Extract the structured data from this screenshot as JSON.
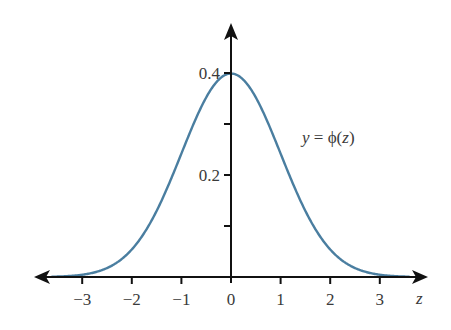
{
  "chart_data": {
    "type": "line",
    "title": "",
    "function": "standard normal probability density",
    "xlabel": "z",
    "ylabel": "",
    "annotation": "y = φ(z)",
    "annotation_parts": {
      "lhs": "y",
      "eq": " = ",
      "fn": "ϕ",
      "open": "(",
      "arg": "z",
      "close": ")"
    },
    "xlim": [
      -3.8,
      3.9
    ],
    "ylim": [
      0,
      0.45
    ],
    "x_ticks": [
      -3,
      -2,
      -1,
      0,
      1,
      2,
      3
    ],
    "x_tick_labels": [
      "−3",
      "−2",
      "−1",
      "0",
      "1",
      "2",
      "3"
    ],
    "y_ticks": [
      0.1,
      0.2,
      0.3,
      0.4
    ],
    "y_tick_labels": [
      "",
      "0.2",
      "",
      "0.4"
    ],
    "grid": false,
    "legend": null,
    "series": [
      {
        "name": "φ(z)",
        "color": "#4a7ea0",
        "x": [
          -3.6,
          -3.0,
          -2.5,
          -2.0,
          -1.5,
          -1.0,
          -0.5,
          0.0,
          0.5,
          1.0,
          1.5,
          2.0,
          2.5,
          3.0,
          3.6
        ],
        "y": [
          0.0006,
          0.0044,
          0.0175,
          0.054,
          0.1295,
          0.242,
          0.3521,
          0.3989,
          0.3521,
          0.242,
          0.1295,
          0.054,
          0.0175,
          0.0044,
          0.0006
        ]
      }
    ],
    "axis_color": "#111111",
    "label_color": "#3a3a3a"
  }
}
